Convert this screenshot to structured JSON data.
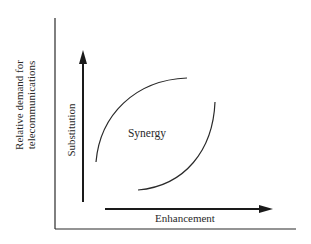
{
  "diagram": {
    "y_axis_label_line1": "Relative demand for",
    "y_axis_label_line2": "telecommunications",
    "vertical_arrow_label": "Substitution",
    "horizontal_arrow_label": "Enhancement",
    "center_label": "Synergy",
    "colors": {
      "line": "#2a2a2a",
      "background": "#ffffff"
    }
  }
}
